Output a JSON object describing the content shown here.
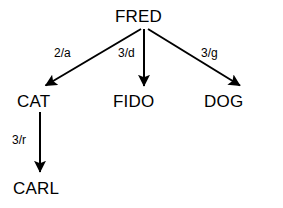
{
  "diagram": {
    "background_color": "#ffffff",
    "stroke_color": "#000000",
    "nodes": [
      {
        "id": "fred",
        "label": "FRED"
      },
      {
        "id": "cat",
        "label": "CAT"
      },
      {
        "id": "fido",
        "label": "FIDO"
      },
      {
        "id": "dog",
        "label": "DOG"
      },
      {
        "id": "carl",
        "label": "CARL"
      }
    ],
    "edges": [
      {
        "id": "fred-cat",
        "from": "FRED",
        "to": "CAT",
        "label": "2/a"
      },
      {
        "id": "fred-fido",
        "from": "FRED",
        "to": "FIDO",
        "label": "3/d"
      },
      {
        "id": "fred-dog",
        "from": "FRED",
        "to": "DOG",
        "label": "3/g"
      },
      {
        "id": "cat-carl",
        "from": "CAT",
        "to": "CARL",
        "label": "3/r"
      }
    ]
  }
}
